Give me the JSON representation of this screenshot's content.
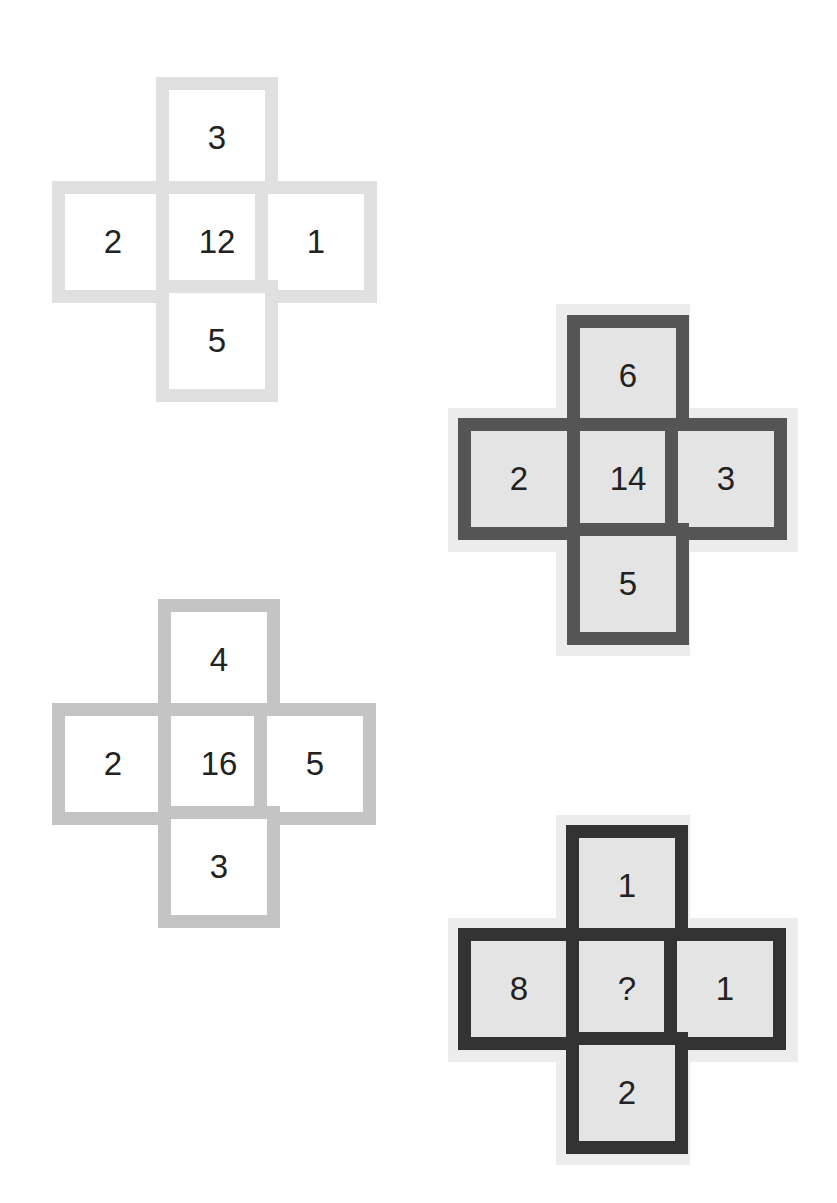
{
  "puzzle": {
    "crosses": [
      {
        "id": "cross-1",
        "position": "top-left",
        "border_color": "#e0e0e0",
        "fill_color": "#ffffff",
        "halo": false,
        "cells": {
          "top": "3",
          "left": "2",
          "center": "12",
          "right": "1",
          "bottom": "5"
        }
      },
      {
        "id": "cross-2",
        "position": "upper-right",
        "border_color": "#555555",
        "fill_color": "#e4e4e4",
        "halo": true,
        "cells": {
          "top": "6",
          "left": "2",
          "center": "14",
          "right": "3",
          "bottom": "5"
        }
      },
      {
        "id": "cross-3",
        "position": "lower-left",
        "border_color": "#c4c4c4",
        "fill_color": "#ffffff",
        "halo": false,
        "cells": {
          "top": "4",
          "left": "2",
          "center": "16",
          "right": "5",
          "bottom": "3"
        }
      },
      {
        "id": "cross-4",
        "position": "bottom-right",
        "border_color": "#333333",
        "fill_color": "#e4e4e4",
        "halo": true,
        "cells": {
          "top": "1",
          "left": "8",
          "center": "?",
          "right": "1",
          "bottom": "2"
        }
      }
    ],
    "halo_color": "#ececec",
    "text_color": "#222222"
  }
}
